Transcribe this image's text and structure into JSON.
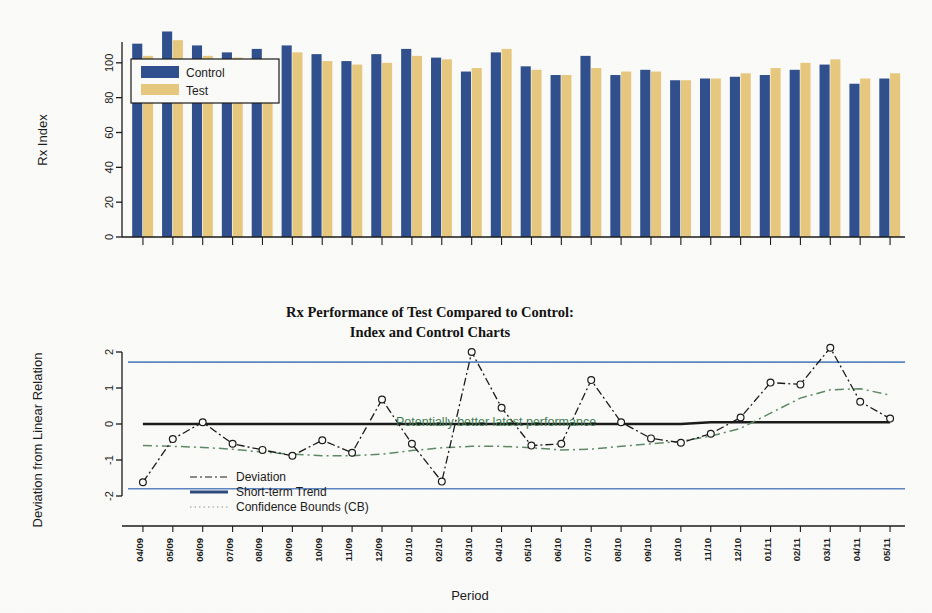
{
  "figure": {
    "title_line1": "Rx Performance of Test Compared to Control:",
    "title_line2": "Index and Control Charts",
    "xlabel": "Period"
  },
  "chart_data": [
    {
      "type": "bar",
      "title": "",
      "xlabel": "",
      "ylabel": "Rx Index",
      "ylim": [
        0,
        120
      ],
      "yticks": [
        0,
        20,
        40,
        60,
        80,
        100
      ],
      "grid": false,
      "legend_position": "top-left",
      "categories": [
        "04/09",
        "05/09",
        "06/09",
        "07/09",
        "08/09",
        "09/09",
        "10/09",
        "11/09",
        "12/09",
        "01/10",
        "02/10",
        "03/10",
        "04/10",
        "05/10",
        "06/10",
        "07/10",
        "08/10",
        "09/10",
        "10/10",
        "11/10",
        "12/10",
        "01/11",
        "02/11",
        "03/11",
        "04/11",
        "05/11"
      ],
      "series": [
        {
          "name": "Control",
          "color": "#2f4f8e",
          "values": [
            111,
            118,
            110,
            106,
            108,
            110,
            105,
            101,
            105,
            108,
            103,
            95,
            106,
            98,
            93,
            104,
            93,
            96,
            90,
            91,
            92,
            93,
            96,
            99,
            88,
            91
          ]
        },
        {
          "name": "Test",
          "color": "#e9c97f",
          "values": [
            104,
            113,
            104,
            103,
            102,
            106,
            101,
            99,
            100,
            104,
            102,
            97,
            108,
            96,
            93,
            97,
            95,
            95,
            90,
            91,
            94,
            97,
            100,
            102,
            91,
            94
          ]
        }
      ]
    },
    {
      "type": "line",
      "title": "Rx Performance of Test Compared to Control: Index and Control Charts",
      "xlabel": "Period",
      "ylabel": "Deviation from Linear Relation",
      "ylim": [
        -2.35,
        2.35
      ],
      "yticks": [
        -2,
        -1,
        0,
        1,
        2
      ],
      "grid": false,
      "legend_position": "bottom-left",
      "categories": [
        "04/09",
        "05/09",
        "06/09",
        "07/09",
        "08/09",
        "09/09",
        "10/09",
        "11/09",
        "12/09",
        "01/10",
        "02/10",
        "03/10",
        "04/10",
        "05/10",
        "06/10",
        "07/10",
        "08/10",
        "09/10",
        "10/10",
        "11/10",
        "12/10",
        "01/11",
        "02/11",
        "03/11",
        "04/11",
        "05/11"
      ],
      "series": [
        {
          "name": "Deviation",
          "style": "dash-dot",
          "color": "#1a1a1a",
          "marker": "circle",
          "values": [
            -1.62,
            -0.42,
            0.05,
            -0.55,
            -0.72,
            -0.88,
            -0.45,
            -0.8,
            0.68,
            -0.55,
            -1.6,
            2.0,
            0.45,
            -0.6,
            -0.55,
            1.22,
            0.05,
            -0.4,
            -0.52,
            -0.27,
            0.18,
            1.15,
            1.1,
            2.12,
            0.62,
            0.15
          ]
        },
        {
          "name": "Short-term Trend",
          "style": "solid",
          "color": "#1a1a1a",
          "values": [
            0.0,
            0.0,
            0.0,
            0.0,
            0.0,
            0.0,
            0.0,
            0.0,
            0.0,
            0.0,
            0.0,
            0.0,
            0.0,
            0.0,
            0.0,
            0.0,
            0.0,
            0.0,
            0.0,
            0.05,
            0.05,
            0.05,
            0.05,
            0.05,
            0.05,
            0.05
          ]
        },
        {
          "name": "Confidence Bounds (CB)",
          "style": "dash-dot",
          "color": "#5e8a66",
          "values": [
            -0.6,
            -0.62,
            -0.65,
            -0.7,
            -0.78,
            -0.84,
            -0.88,
            -0.88,
            -0.84,
            -0.74,
            -0.66,
            -0.62,
            -0.62,
            -0.66,
            -0.72,
            -0.7,
            -0.62,
            -0.55,
            -0.48,
            -0.34,
            -0.12,
            0.3,
            0.72,
            0.95,
            0.98,
            0.8
          ]
        }
      ],
      "control_limits": {
        "upper": 1.72,
        "lower": -1.8,
        "color": "#5b86c4"
      },
      "zero_line": 0.0,
      "annotations": [
        {
          "text": "Potentially better latest performance",
          "x_index": 16,
          "y": 0.12,
          "color": "#3f7d52"
        }
      ]
    }
  ],
  "legends": {
    "bar_chart": [
      {
        "label": "Control",
        "color": "#2f4f8e"
      },
      {
        "label": "Test",
        "color": "#e9c97f"
      }
    ],
    "line_chart": [
      {
        "label": "Deviation",
        "color": "#1a1a1a",
        "style": "dash-dot"
      },
      {
        "label": "Short-term Trend",
        "color": "#2b4a7d",
        "style": "solid"
      },
      {
        "label": "Confidence Bounds (CB)",
        "color": "#8a9a8d",
        "style": "dotted"
      }
    ]
  }
}
